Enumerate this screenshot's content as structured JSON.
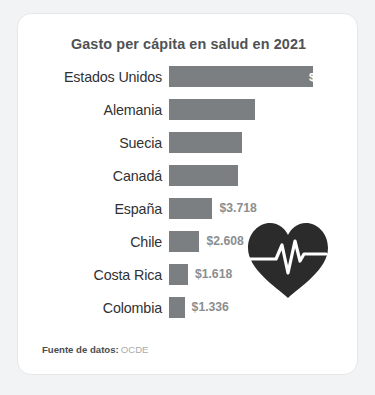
{
  "card": {
    "title": "Gasto per cápita en salud en 2021",
    "footer_label": "Fuente de datos:",
    "footer_source": "OCDE"
  },
  "icons": {
    "heart_pulse": "heart-pulse-icon"
  },
  "colors": {
    "bar": "#7c7f81",
    "bar_label_inside": "#ffffff",
    "bar_label_outside": "#8b8e90",
    "title": "#4f5254",
    "category_label": "#2f3133",
    "card_background": "#ffffff",
    "page_background": "#f2f3f4",
    "heart": "#2b2b2b"
  },
  "chart_data": {
    "type": "bar",
    "orientation": "horizontal",
    "title": "Gasto per cápita en salud en 2021",
    "xlabel": "",
    "ylabel": "",
    "grid": false,
    "legend": null,
    "value_prefix": "$",
    "value_thousands_separator": ".",
    "xlim": [
      0,
      12318
    ],
    "categories": [
      "Estados Unidos",
      "Alemania",
      "Suecia",
      "Canadá",
      "España",
      "Chile",
      "Costa Rica",
      "Colombia"
    ],
    "values": [
      12318,
      7383,
      6262,
      5905,
      3718,
      2608,
      1618,
      1336
    ],
    "value_labels": [
      "$12.318",
      "$7.383",
      "$6.262",
      "$5.905",
      "$3.718",
      "$2.608",
      "$1.618",
      "$1.336"
    ],
    "label_placement": [
      "inside",
      "inside",
      "inside",
      "inside",
      "outside",
      "outside",
      "outside",
      "outside"
    ]
  }
}
